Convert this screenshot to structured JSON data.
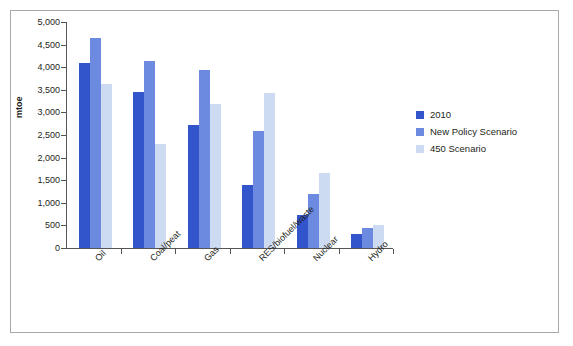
{
  "chart_data": {
    "type": "bar",
    "title": "",
    "xlabel": "",
    "ylabel": "mtoe",
    "ylim": [
      0,
      5000
    ],
    "ytick_step": 500,
    "grid": false,
    "legend_position": "right",
    "categories": [
      "Oil",
      "Coal/peat",
      "Gas",
      "RES/biofuel/waste",
      "Nuclear",
      "Hydro"
    ],
    "ytick_labels": [
      "0",
      "500",
      "1,000",
      "1,500",
      "2,000",
      "2,500",
      "3,000",
      "3,500",
      "4,000",
      "4,500",
      "5,000"
    ],
    "series": [
      {
        "name": "2010",
        "color": "#3355cc",
        "values": [
          4100,
          3450,
          2720,
          1400,
          720,
          300
        ]
      },
      {
        "name": "New Policy Scenario",
        "color": "#6b8ae0",
        "values": [
          4650,
          4130,
          3930,
          2590,
          1200,
          450
        ]
      },
      {
        "name": "450 Scenario",
        "color": "#ccdaf2",
        "values": [
          3620,
          2310,
          3190,
          3440,
          1650,
          500
        ]
      }
    ]
  },
  "legend": {
    "items": [
      {
        "label": "2010"
      },
      {
        "label": "New Policy Scenario"
      },
      {
        "label": "450 Scenario"
      }
    ]
  }
}
